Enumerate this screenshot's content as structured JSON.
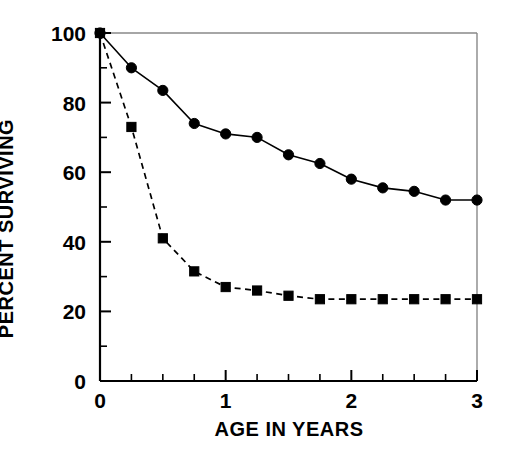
{
  "chart_data": {
    "type": "line",
    "title": "",
    "xlabel": "AGE IN YEARS",
    "ylabel": "PERCENT SURVIVING",
    "xlim": [
      0,
      3
    ],
    "ylim": [
      0,
      100
    ],
    "xticks": [
      0,
      1,
      2,
      3
    ],
    "xtick_labels": [
      "0",
      "1",
      "2",
      "3"
    ],
    "xticks_minor": [
      0.25,
      0.5,
      0.75,
      1.25,
      1.5,
      1.75,
      2.25,
      2.5,
      2.75
    ],
    "yticks": [
      0,
      20,
      40,
      60,
      80,
      100
    ],
    "ytick_labels": [
      "0",
      "20",
      "40",
      "60",
      "80",
      "100"
    ],
    "yticks_minor": [
      10,
      30,
      50,
      70,
      90
    ],
    "grid": false,
    "legend": "none",
    "series": [
      {
        "name": "solid-circles",
        "marker": "circle",
        "linestyle": "solid",
        "color": "#000000",
        "x": [
          0,
          0.25,
          0.5,
          0.75,
          1.0,
          1.25,
          1.5,
          1.75,
          2.0,
          2.25,
          2.5,
          2.75,
          3.0
        ],
        "values": [
          100,
          90,
          83.5,
          74,
          71,
          70,
          65,
          62.5,
          58,
          55.5,
          54.5,
          52,
          52
        ]
      },
      {
        "name": "dashed-squares",
        "marker": "square",
        "linestyle": "dashed",
        "color": "#000000",
        "x": [
          0,
          0.25,
          0.5,
          0.75,
          1.0,
          1.25,
          1.5,
          1.75,
          2.0,
          2.25,
          2.5,
          2.75,
          3.0
        ],
        "values": [
          100,
          73,
          41,
          31.5,
          27,
          26,
          24.5,
          23.5,
          23.5,
          23.5,
          23.5,
          23.5,
          23.5
        ]
      }
    ]
  }
}
